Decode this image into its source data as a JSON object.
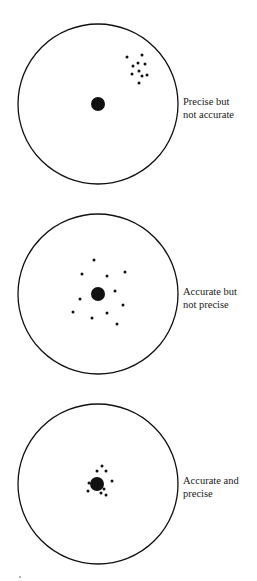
{
  "figure": {
    "title": "",
    "targets": [
      {
        "id": "precise-not-accurate",
        "label_lines": [
          "Precise but",
          "not accurate"
        ],
        "circle": {
          "cx": 98,
          "cy": 104,
          "r": 80
        },
        "bullseye": {
          "cx": 98,
          "cy": 104,
          "r": 7
        },
        "shots": [
          [
            127,
            57
          ],
          [
            142,
            55
          ],
          [
            133,
            66
          ],
          [
            138,
            63
          ],
          [
            145,
            64
          ],
          [
            139,
            71
          ],
          [
            132,
            74
          ],
          [
            142,
            76
          ],
          [
            147,
            75
          ],
          [
            139,
            83
          ]
        ],
        "label_top": 95
      },
      {
        "id": "accurate-not-precise",
        "label_lines": [
          "Accurate but",
          "not precise"
        ],
        "circle": {
          "cx": 98,
          "cy": 294,
          "r": 80
        },
        "bullseye": {
          "cx": 98,
          "cy": 294,
          "r": 7
        },
        "shots": [
          [
            94,
            260
          ],
          [
            82,
            274
          ],
          [
            107,
            276
          ],
          [
            125,
            272
          ],
          [
            115,
            291
          ],
          [
            80,
            299
          ],
          [
            123,
            305
          ],
          [
            73,
            312
          ],
          [
            92,
            318
          ],
          [
            107,
            313
          ],
          [
            117,
            324
          ]
        ],
        "label_top": 285
      },
      {
        "id": "accurate-and-precise",
        "label_lines": [
          "Accurate and",
          "precise"
        ],
        "circle": {
          "cx": 98,
          "cy": 484,
          "r": 80
        },
        "bullseye": {
          "cx": 97,
          "cy": 484,
          "r": 7
        },
        "shots": [
          [
            102,
            466
          ],
          [
            97,
            471
          ],
          [
            106,
            471
          ],
          [
            112,
            481
          ],
          [
            89,
            483
          ],
          [
            88,
            491
          ],
          [
            101,
            493
          ],
          [
            106,
            495
          ],
          [
            104,
            489
          ]
        ],
        "label_top": 474
      }
    ],
    "colors": {
      "ink": "#111111",
      "background": "#ffffff"
    }
  }
}
